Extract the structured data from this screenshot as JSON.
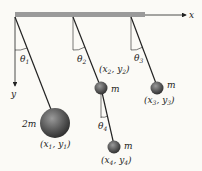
{
  "diagram": {
    "title": "",
    "axes": {
      "x_label": "x",
      "y_label": "y"
    },
    "angles": [
      {
        "symbol": "θ",
        "sub": "1"
      },
      {
        "symbol": "θ",
        "sub": "2"
      },
      {
        "symbol": "θ",
        "sub": "3"
      },
      {
        "symbol": "θ",
        "sub": "4"
      }
    ],
    "masses": [
      {
        "label": "2m",
        "coord": "(x",
        "s1": "1",
        "mid": ", y",
        "s2": "1",
        "end": ")"
      },
      {
        "label": "m",
        "coord": "(x",
        "s1": "2",
        "mid": ", y",
        "s2": "2",
        "end": ")"
      },
      {
        "label": "m",
        "coord": "(x",
        "s1": "3",
        "mid": ", y",
        "s2": "3",
        "end": ")"
      },
      {
        "label": "m",
        "coord": "(x",
        "s1": "4",
        "mid": ", y",
        "s2": "4",
        "end": ")"
      }
    ],
    "colors": {
      "beam": "#9a9a9a",
      "rod": "#222222",
      "ball": "#555555",
      "background": "#fbfaf6"
    }
  }
}
